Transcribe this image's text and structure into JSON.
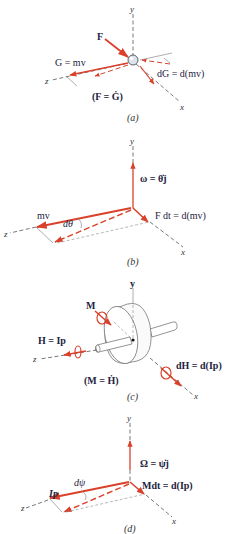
{
  "colors": {
    "vector": "#d9412b",
    "text": "#1d2340",
    "axis": "#555555"
  },
  "panels": [
    {
      "id": "a",
      "caption": "(a)",
      "axes": {
        "y": "y",
        "z": "z",
        "x": "x"
      },
      "labels": {
        "force": "F",
        "momentum": "G = mv",
        "momentum_change": "dG = d(mv)",
        "equation": "(F = Ġ)"
      }
    },
    {
      "id": "b",
      "caption": "(b)",
      "axes": {
        "y": "y",
        "z": "z",
        "x": "x"
      },
      "labels": {
        "angular_velocity": "ω = θ̇j",
        "momentum": "mv",
        "angle": "dθ",
        "impulse": "F dt = d(mv)"
      }
    },
    {
      "id": "c",
      "caption": "(c)",
      "axes": {
        "y": "y",
        "z": "z",
        "x": "x"
      },
      "labels": {
        "moment": "M",
        "angular_momentum": "H = Ip",
        "angular_momentum_change": "dH = d(Ip)",
        "equation": "(M = Ḣ)"
      }
    },
    {
      "id": "d",
      "caption": "(d)",
      "axes": {
        "y": "y",
        "z": "z",
        "x": "x"
      },
      "labels": {
        "precession_rate": "Ω = ψ̇j",
        "spin_momentum": "Ip",
        "angle": "dψ",
        "angular_impulse": "Mdt = d(Ip)"
      }
    }
  ]
}
